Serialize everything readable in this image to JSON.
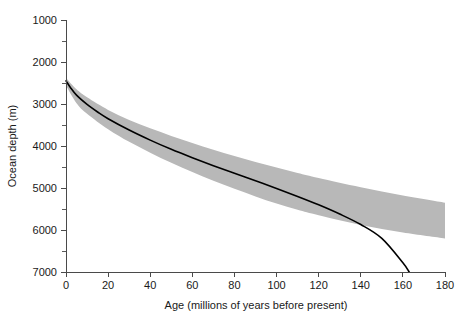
{
  "chart_data": {
    "type": "line",
    "title": "",
    "xlabel": "Age  (millions of years before present)",
    "ylabel": "Ocean depth (m)",
    "xlim": [
      0,
      180
    ],
    "ylim": [
      7000,
      1000
    ],
    "y_axis_inverted": true,
    "grid": false,
    "legend": "none",
    "x_ticks": [
      0,
      20,
      40,
      60,
      80,
      100,
      120,
      140,
      160,
      180
    ],
    "x_tick_labels": [
      "0",
      "20",
      "40",
      "60",
      "80",
      "100",
      "120",
      "140",
      "160",
      "180"
    ],
    "x_minor_tick_interval": 20,
    "y_ticks": [
      1000,
      2000,
      3000,
      4000,
      5000,
      6000,
      7000
    ],
    "y_tick_labels": [
      "1000",
      "2000",
      "3000",
      "4000",
      "5000",
      "6000",
      "7000"
    ],
    "y_minor_ticks": [
      1500,
      2500,
      3500,
      4500,
      5500,
      6500
    ],
    "series": [
      {
        "name": "theoretical-subsidence-curve",
        "style": "solid-black-line",
        "color": "#000000",
        "x": [
          0,
          2,
          5,
          10,
          15,
          20,
          30,
          40,
          50,
          60,
          70,
          80,
          90,
          100,
          110,
          120,
          130,
          140,
          150,
          160,
          163
        ],
        "y": [
          2450,
          2600,
          2790,
          3010,
          3190,
          3350,
          3620,
          3860,
          4080,
          4280,
          4470,
          4650,
          4830,
          5010,
          5200,
          5400,
          5620,
          5870,
          6200,
          6780,
          7000
        ]
      },
      {
        "name": "observed-depth-envelope-upper",
        "style": "gray-band-edge",
        "color": "#b8b8b8",
        "x": [
          0,
          5,
          10,
          20,
          30,
          40,
          50,
          60,
          70,
          80,
          90,
          100,
          110,
          120,
          140,
          160,
          180
        ],
        "y": [
          2380,
          2650,
          2840,
          3140,
          3380,
          3580,
          3760,
          3930,
          4090,
          4240,
          4380,
          4510,
          4640,
          4760,
          4980,
          5180,
          5350
        ]
      },
      {
        "name": "observed-depth-envelope-lower",
        "style": "gray-band-edge",
        "color": "#b8b8b8",
        "x": [
          0,
          5,
          10,
          20,
          30,
          40,
          50,
          60,
          70,
          80,
          90,
          100,
          110,
          120,
          140,
          160,
          180
        ],
        "y": [
          2560,
          2980,
          3230,
          3600,
          3900,
          4160,
          4400,
          4620,
          4830,
          5020,
          5200,
          5370,
          5520,
          5650,
          5880,
          6060,
          6200
        ]
      }
    ],
    "annotations": [],
    "band_color": "#b8b8b8",
    "curve_color": "#000000",
    "axis_color": "#4a4a4a",
    "background_color": "#ffffff"
  },
  "axes": {
    "x_title": "Age  (millions of years before present)",
    "y_title": "Ocean depth (m)"
  }
}
